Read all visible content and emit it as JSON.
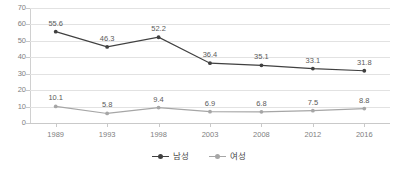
{
  "chart_data": {
    "type": "line",
    "title": "",
    "subtitle": "",
    "xlabel": "",
    "ylabel": "",
    "categories": [
      "1989",
      "1993",
      "1998",
      "2003",
      "2008",
      "2012",
      "2016"
    ],
    "ylim": [
      0,
      70
    ],
    "yticks": [
      0,
      10,
      20,
      30,
      40,
      50,
      60,
      70
    ],
    "ytick_labels": [
      "0",
      "10",
      "20",
      "30",
      "40",
      "50",
      "60",
      "70"
    ],
    "grid": true,
    "grid_axis": "y",
    "legend_position": "bottom",
    "series": [
      {
        "name": "남성",
        "color": "#404040",
        "marker": "circle",
        "values": [
          55.6,
          46.3,
          52.2,
          36.4,
          35.1,
          33.1,
          31.8
        ],
        "labels": [
          "55.6",
          "46.3",
          "52.2",
          "36.4",
          "35.1",
          "33.1",
          "31.8"
        ]
      },
      {
        "name": "여성",
        "color": "#a6a6a6",
        "marker": "circle",
        "values": [
          10.1,
          5.8,
          9.4,
          6.9,
          6.8,
          7.5,
          8.8
        ],
        "labels": [
          "10.1",
          "5.8",
          "9.4",
          "6.9",
          "6.8",
          "7.5",
          "8.8"
        ]
      }
    ]
  },
  "legend": {
    "items": [
      {
        "label": "남성",
        "color": "#404040"
      },
      {
        "label": "여성",
        "color": "#a6a6a6"
      }
    ]
  },
  "colors": {
    "male_series": "#404040",
    "female_series": "#a6a6a6",
    "grid": "#e2e2e2",
    "axis": "#c9c9c9",
    "tick_text": "#808080",
    "label_text": "#5a5a5a",
    "background": "#ffffff"
  }
}
